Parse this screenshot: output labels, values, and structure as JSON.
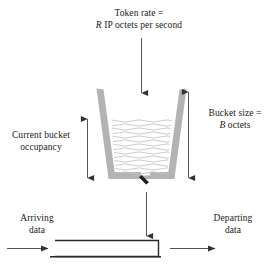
{
  "figure": {
    "labels": {
      "token_rate_line1": "Token rate =",
      "token_rate_var": "R",
      "token_rate_line2_rest": " IP octets per second",
      "bucket_size_line1": "Bucket size =",
      "bucket_size_var": "B",
      "bucket_size_line2_rest": " octets",
      "occupancy_line1": "Current bucket",
      "occupancy_line2": "occupancy",
      "arriving_line1": "Arriving",
      "arriving_line2": "data",
      "departing_line1": "Departing",
      "departing_line2": "data"
    },
    "elements": {
      "bucket": "token-bucket",
      "water": "bucket-contents-wavy-fill",
      "spout": "bucket-outlet-valve",
      "pipe": "data-pipe",
      "inflow_arrow": "token-inflow-arrow",
      "outflow_arrow": "token-outflow-arrow",
      "bucket_size_arrow": "bucket-size-dimension-arrow",
      "occupancy_arrow": "occupancy-dimension-arrow",
      "arriving_arrow": "arriving-data-arrow",
      "departing_arrow": "departing-data-arrow"
    },
    "colors": {
      "bucket_wall": "#b0b0b0",
      "water_line": "#c8c8c8",
      "stroke": "#4a4a4a",
      "pipe_stroke": "#2b2b2b",
      "text": "#1a1a1a",
      "background": "#ffffff"
    }
  }
}
